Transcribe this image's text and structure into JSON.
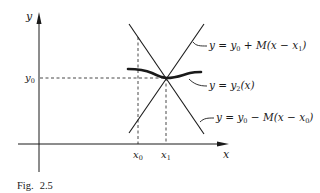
{
  "figure": {
    "caption_prefix": "Fig.",
    "caption_number": "2.5",
    "axes": {
      "x_label": "x",
      "y_label": "y"
    },
    "ticks": {
      "y0_label_main": "y",
      "y0_label_sub": "0",
      "x0_label_main": "x",
      "x0_label_sub": "0",
      "x1_label_main": "x",
      "x1_label_sub": "1"
    },
    "curves": [
      {
        "id": "upper-line",
        "label_parts": [
          "y = y",
          "0",
          " + M(x − x",
          "1",
          ")"
        ]
      },
      {
        "id": "solution-curve",
        "label_parts": [
          "y = y",
          "2",
          "(x)"
        ]
      },
      {
        "id": "lower-line",
        "label_parts": [
          "y = y",
          "0",
          " − M(x − x",
          "0",
          ")"
        ]
      }
    ],
    "colors": {
      "ink": "#1a1a1a",
      "background": "#ffffff"
    }
  }
}
